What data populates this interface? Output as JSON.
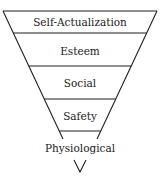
{
  "diagram": {
    "type": "inverted-pyramid",
    "levels": [
      {
        "label": "Self-Actualization"
      },
      {
        "label": "Esteem"
      },
      {
        "label": "Social"
      },
      {
        "label": "Safety"
      },
      {
        "label": "Physiological"
      }
    ],
    "bottom_marker": "V",
    "line_color": "#1e1e1e",
    "text_color": "#1a1a1a",
    "background": "#ffffff"
  }
}
